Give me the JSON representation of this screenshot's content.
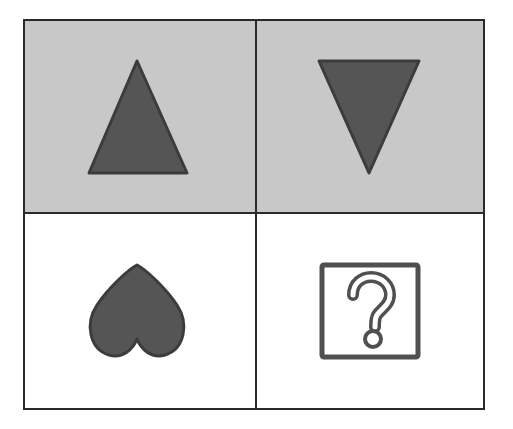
{
  "puzzle": {
    "type": "2x2 analogy grid",
    "colors": {
      "border": "#2a2a2a",
      "shaded_background": "#c8c8c8",
      "blank_background": "#ffffff",
      "shape_fill": "#555555",
      "shape_stroke": "#3c3c3c"
    },
    "cells": [
      {
        "row": 0,
        "col": 0,
        "shape": "triangle-up",
        "background": "shaded"
      },
      {
        "row": 0,
        "col": 1,
        "shape": "triangle-down",
        "background": "shaded"
      },
      {
        "row": 1,
        "col": 0,
        "shape": "heart-inverted",
        "background": "blank"
      },
      {
        "row": 1,
        "col": 1,
        "shape": "question-mark-box",
        "background": "blank",
        "glyph": "?"
      }
    ]
  }
}
